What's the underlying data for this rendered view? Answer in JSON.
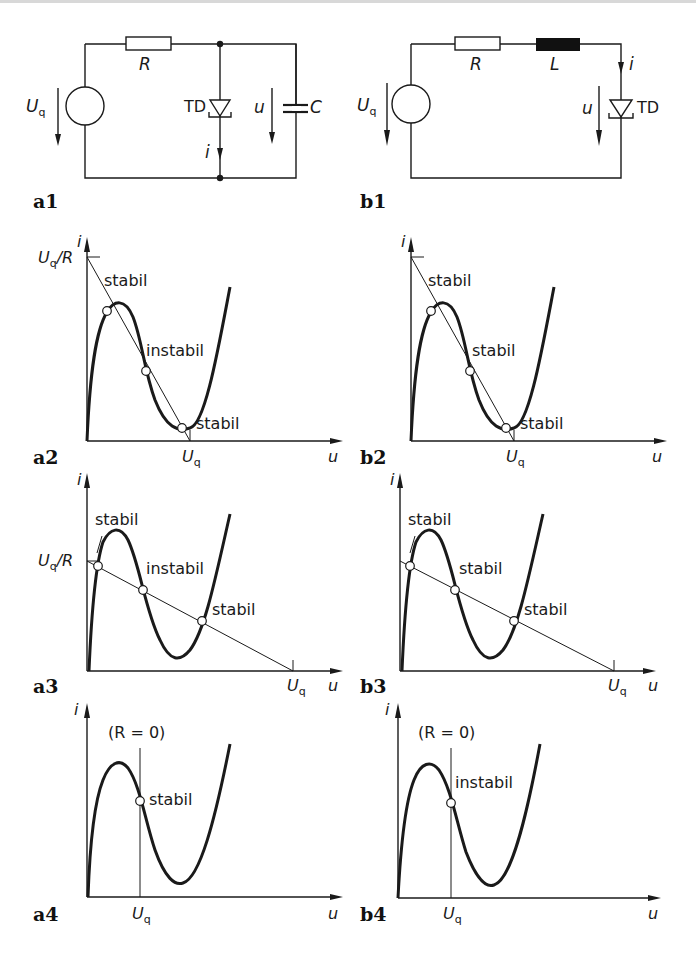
{
  "figure": {
    "panels": {
      "a1": {
        "id": "a1",
        "type": "circuit",
        "components": {
          "source": "U",
          "source_sub": "q",
          "resistor": "R",
          "diode": "TD",
          "capacitor": "C",
          "voltage": "u",
          "current": "i"
        }
      },
      "b1": {
        "id": "b1",
        "type": "circuit",
        "components": {
          "source": "U",
          "source_sub": "q",
          "resistor": "R",
          "inductor": "L",
          "diode": "TD",
          "voltage": "u",
          "current": "i"
        }
      },
      "a2": {
        "id": "a2",
        "y_axis": "i",
        "x_axis": "u",
        "y_tick": "U",
        "y_tick_sub": "q",
        "y_tick_suffix": "/R",
        "x_tick": "U",
        "x_tick_sub": "q",
        "points": [
          "stabil",
          "instabil",
          "stabil"
        ]
      },
      "b2": {
        "id": "b2",
        "y_axis": "i",
        "x_axis": "u",
        "x_tick": "U",
        "x_tick_sub": "q",
        "points": [
          "stabil",
          "stabil",
          "stabil"
        ]
      },
      "a3": {
        "id": "a3",
        "y_axis": "i",
        "x_axis": "u",
        "y_tick": "U",
        "y_tick_sub": "q",
        "y_tick_suffix": "/R",
        "x_tick": "U",
        "x_tick_sub": "q",
        "points": [
          "stabil",
          "instabil",
          "stabil"
        ]
      },
      "b3": {
        "id": "b3",
        "y_axis": "i",
        "x_axis": "u",
        "x_tick": "U",
        "x_tick_sub": "q",
        "points": [
          "stabil",
          "stabil",
          "stabil"
        ]
      },
      "a4": {
        "id": "a4",
        "y_axis": "i",
        "x_axis": "u",
        "x_tick": "U",
        "x_tick_sub": "q",
        "condition": "(R = 0)",
        "points": [
          "stabil"
        ]
      },
      "b4": {
        "id": "b4",
        "y_axis": "i",
        "x_axis": "u",
        "x_tick": "U",
        "x_tick_sub": "q",
        "condition": "(R = 0)",
        "points": [
          "instabil"
        ]
      }
    }
  },
  "colors": {
    "ink": "#1a1a1a",
    "background": "#ffffff",
    "inductor_fill": "#111111"
  }
}
